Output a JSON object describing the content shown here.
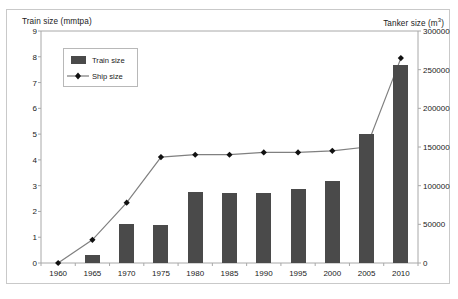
{
  "chart_data": {
    "type": "bar",
    "title": "",
    "categories": [
      "1960",
      "1965",
      "1970",
      "1975",
      "1980",
      "1985",
      "1990",
      "1995",
      "2000",
      "2005",
      "2010"
    ],
    "xlabel": "",
    "ylabel": "Train size (mmtpa)",
    "y2label": "Tanker size (m3)",
    "ylim": [
      0,
      9
    ],
    "y2lim": [
      0,
      300000
    ],
    "yticks": [
      "0",
      "1",
      "2",
      "3",
      "4",
      "5",
      "6",
      "7",
      "8",
      "9"
    ],
    "y2ticks": [
      "0",
      "50000",
      "100000",
      "150000",
      "200000",
      "250000",
      "300000"
    ],
    "grid": false,
    "legend_position": "upper-left-inside",
    "series": [
      {
        "name": "Train size",
        "render": "bar",
        "axis": "left",
        "unit": "mmtpa",
        "color": "#4a4a4a",
        "values": [
          0,
          0.3,
          1.5,
          1.48,
          2.75,
          2.72,
          2.7,
          2.88,
          3.2,
          5.0,
          7.7
        ]
      },
      {
        "name": "Ship size",
        "render": "line",
        "axis": "right",
        "unit": "m3",
        "color": "#808080",
        "marker": "diamond",
        "marker_color": "#111111",
        "values": [
          0,
          30000,
          78000,
          137000,
          140000,
          140000,
          143000,
          143000,
          145000,
          150000,
          265000
        ]
      }
    ]
  },
  "axes": {
    "left_title": "Train size (mmtpa)",
    "right_title_prefix": "Tanker size (m",
    "right_title_sup": "3",
    "right_title_suffix": ")"
  },
  "legend": {
    "train_label": "Train size",
    "ship_label": "Ship size"
  }
}
